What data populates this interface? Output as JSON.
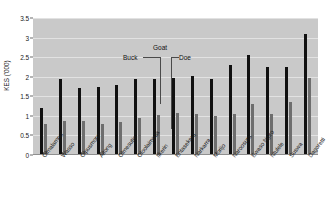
{
  "chart_data": {
    "type": "bar",
    "title": "",
    "subtitle": "",
    "xlabel": "",
    "ylabel": "KES ('000)",
    "ylim": [
      0,
      3.5
    ],
    "yticks": [
      "0",
      "0.5",
      "1",
      "1.5",
      "2",
      "2.5",
      "3",
      "3.5"
    ],
    "ytick_values": [
      0,
      0.5,
      1,
      1.5,
      2,
      2.5,
      3,
      3.5
    ],
    "grid": true,
    "legend_position": "inside-top-center",
    "legend_group_title": "Goat",
    "categories": [
      "Olmalampu",
      "Wasso",
      "Olpusmoro",
      "Aitong",
      "Olmesutie",
      "Oloolaimutia",
      "Ilkerin",
      "Entasekera",
      "Narkarra",
      "Morijo",
      "Naroosura",
      "Ewaso Ngiro",
      "Ntulele",
      "Suswa",
      "Dagoretti"
    ],
    "series": [
      {
        "name": "Buck",
        "color": "#111111",
        "values": [
          1.2,
          1.95,
          1.7,
          1.75,
          1.78,
          1.95,
          1.94,
          1.96,
          2.02,
          1.95,
          2.3,
          2.55,
          2.25,
          2.25,
          3.1
        ]
      },
      {
        "name": "Doe",
        "color": "#6E6E6E",
        "values": [
          0.8,
          0.86,
          0.86,
          0.8,
          0.85,
          0.95,
          1.02,
          1.07,
          1.05,
          1.0,
          1.05,
          1.3,
          1.05,
          1.35,
          1.98
        ]
      }
    ],
    "annotations": [
      {
        "name": "buck-callout",
        "text": "Buck"
      },
      {
        "name": "doe-callout",
        "text": "Doe"
      },
      {
        "name": "goat-callout",
        "text": "Goat"
      }
    ]
  },
  "colors": {
    "plot_background": "#C9C9C9",
    "grid": "#E2E2E2",
    "axis": "#6B6B6B",
    "buck": "#111111",
    "doe": "#6E6E6E",
    "text": "#1A1A1A"
  }
}
